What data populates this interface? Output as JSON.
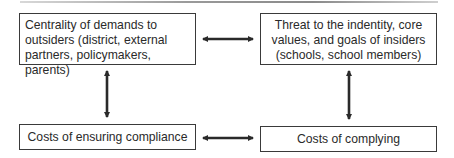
{
  "diagram": {
    "nodes": [
      {
        "id": "centrality",
        "lines": [
          "Centrality of demands to",
          "outsiders (district, external",
          "partners, policymakers, parents)"
        ]
      },
      {
        "id": "threat",
        "lines": [
          "Threat to the indentity, core",
          "values, and goals of insiders",
          "(schools, school members)"
        ]
      },
      {
        "id": "ensuring",
        "lines": [
          "Costs of ensuring compliance"
        ]
      },
      {
        "id": "complying",
        "lines": [
          "Costs of complying"
        ]
      }
    ],
    "edges": [
      {
        "from": "centrality",
        "to": "threat",
        "type": "bidirectional"
      },
      {
        "from": "centrality",
        "to": "ensuring",
        "type": "bidirectional"
      },
      {
        "from": "threat",
        "to": "complying",
        "type": "bidirectional"
      },
      {
        "from": "ensuring",
        "to": "complying",
        "type": "bidirectional"
      }
    ],
    "colors": {
      "box_border": "#3a3a3a",
      "arrow": "#2a2a2a",
      "text": "#2a2a2a",
      "rule": "#8a8a8a"
    }
  }
}
